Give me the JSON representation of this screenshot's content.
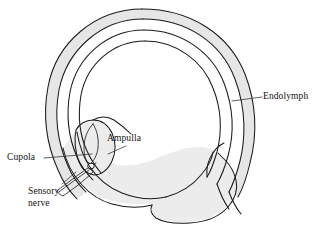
{
  "figure": {
    "background_color": "#ffffff",
    "line_color": "#1a1a1a",
    "fill_color": "#ececec",
    "width": 319,
    "height": 228
  },
  "labels": {
    "endolymph": "Endolymph",
    "ampulla": "Ampulla",
    "cupola": "Cupola",
    "sensory_nerve_line1": "Sensory",
    "sensory_nerve_line2": "nerve"
  },
  "structures": [
    {
      "name": "semicircular-canal-outer-wall",
      "label": "Endolymph"
    },
    {
      "name": "semicircular-canal-lumen",
      "label": "Endolymph"
    },
    {
      "name": "ampulla",
      "label": "Ampulla"
    },
    {
      "name": "cupola",
      "label": "Cupola"
    },
    {
      "name": "sensory-nerve",
      "label": "Sensory nerve"
    },
    {
      "name": "utricle-vestibule",
      "label": ""
    }
  ]
}
